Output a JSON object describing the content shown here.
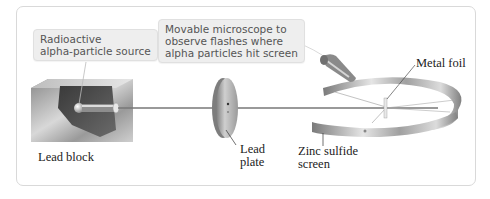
{
  "diagram": {
    "callouts": {
      "source": {
        "lines": [
          "Radioactive",
          "alpha-particle source"
        ]
      },
      "microscope": {
        "lines": [
          "Movable microscope to",
          "observe flashes where",
          "alpha particles hit screen"
        ]
      }
    },
    "labels": {
      "lead_block": "Lead block",
      "lead_plate": [
        "Lead",
        "plate"
      ],
      "zinc_sulfide": [
        "Zinc sulfide",
        "screen"
      ],
      "metal_foil": "Metal foil"
    },
    "colors": {
      "callout_bg": "#eeeeee",
      "callout_text": "#555555",
      "label_text": "#222222",
      "panel_border": "#d9d9d9"
    }
  }
}
